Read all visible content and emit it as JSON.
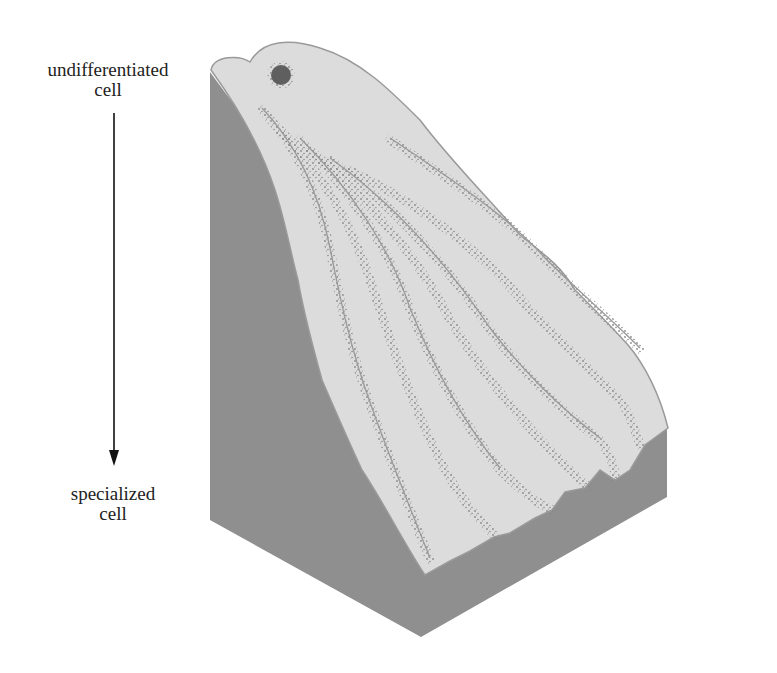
{
  "diagram": {
    "labels": {
      "top_line1": "undifferentiated",
      "top_line2": "cell",
      "bottom_line1": "specialized",
      "bottom_line2": "cell"
    },
    "arrow": {
      "direction": "down",
      "meaning": "differentiation progression"
    },
    "illustration": {
      "ball": "undifferentiated cell (marble at top of landscape)",
      "valleys_count": 7
    },
    "colors": {
      "block_side": "#8f8f8f",
      "surface": "#dcdcdc",
      "surface_edge": "#9a9a9a",
      "stipple": "#8a8a8a",
      "ball": "#5f5f5f",
      "text": "#222222",
      "arrow": "#111111",
      "background": "#ffffff"
    }
  }
}
